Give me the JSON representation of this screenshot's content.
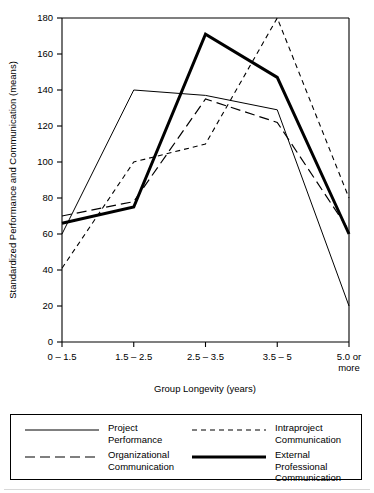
{
  "chart_data": {
    "type": "line",
    "title": "",
    "xlabel": "Group Longevity (years)",
    "ylabel": "Standardized Performance and Communication (means)",
    "categories": [
      "0 – 1.5",
      "1.5 – 2.5",
      "2.5 – 3.5",
      "3.5 – 5",
      "5.0 or\nmore"
    ],
    "category_labels_flat": [
      "0 – 1.5",
      "1.5 – 2.5",
      "2.5 – 3.5",
      "3.5 – 5",
      "5.0 or more"
    ],
    "ylim": [
      0,
      180
    ],
    "yticks": [
      0,
      20,
      40,
      60,
      80,
      100,
      120,
      140,
      160,
      180
    ],
    "grid": false,
    "legend_position": "below-plot",
    "series": [
      {
        "name": "Project\nPerformance",
        "name_flat": "Project Performance",
        "style": "thin-solid",
        "color": "#000000",
        "values": [
          60,
          140,
          137,
          129,
          20
        ]
      },
      {
        "name": "Intraproject\nCommunication",
        "name_flat": "Intraproject Communication",
        "style": "short-dash",
        "color": "#000000",
        "values": [
          41,
          100,
          110,
          180,
          80
        ]
      },
      {
        "name": "Organizational\nCommunication",
        "name_flat": "Organizational Communication",
        "style": "long-dash",
        "color": "#000000",
        "values": [
          70,
          78,
          135,
          122,
          62
        ]
      },
      {
        "name": "External Professional\nCommunication",
        "name_flat": "External Professional Communication",
        "style": "thick-solid",
        "color": "#000000",
        "values": [
          66,
          75,
          171,
          147,
          60
        ]
      }
    ]
  },
  "axes": {
    "y_tick_labels": [
      "180",
      "160",
      "140",
      "120",
      "100",
      "80",
      "60",
      "40",
      "20",
      "0"
    ],
    "x_tick_labels": [
      "0 – 1.5",
      "1.5 – 2.5",
      "2.5 – 3.5",
      "3.5 – 5",
      "5.0 or"
    ],
    "x_tick_label_last_line2": "more",
    "x_axis_title": "Group Longevity (years)",
    "y_axis_title": "Standardized Performance and Communication (means)"
  },
  "legend": {
    "entries": [
      {
        "label": "Project\nPerformance",
        "style": "thin-solid"
      },
      {
        "label": "Intraproject\nCommunication",
        "style": "short-dash"
      },
      {
        "label": "Organizational\nCommunication",
        "style": "long-dash"
      },
      {
        "label": "External Professional\nCommunication",
        "style": "thick-solid"
      }
    ]
  }
}
